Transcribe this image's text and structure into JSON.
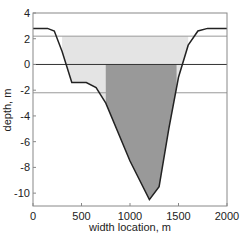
{
  "chart_data": {
    "type": "area",
    "title": "",
    "xlabel": "width location, m",
    "ylabel": "depth, m",
    "xlim": [
      0,
      2000
    ],
    "ylim": [
      -11,
      4
    ],
    "xticks": [
      0,
      500,
      1000,
      1500,
      2000
    ],
    "yticks": [
      4,
      2,
      0,
      -2,
      -4,
      -6,
      -8,
      -10
    ],
    "grid": false,
    "reference_lines": [
      {
        "y": 2.2,
        "color": "#999999"
      },
      {
        "y": 0,
        "color": "#333333"
      },
      {
        "y": -2.2,
        "color": "#999999"
      }
    ],
    "series": [
      {
        "name": "channel profile",
        "color": "#222222",
        "x": [
          0,
          150,
          220,
          300,
          400,
          550,
          650,
          750,
          1000,
          1200,
          1300,
          1400,
          1500,
          1600,
          1700,
          1800,
          2000
        ],
        "y": [
          2.8,
          2.8,
          2.6,
          1.0,
          -1.4,
          -1.4,
          -1.8,
          -3.0,
          -7.5,
          -10.5,
          -9.5,
          -5.0,
          -1.0,
          1.5,
          2.6,
          2.8,
          2.8
        ]
      }
    ],
    "fills": [
      {
        "name": "main channel",
        "x_range": [
          750,
          1480
        ],
        "top": 0,
        "color": "#999999"
      },
      {
        "name": "overbank",
        "x_range": [
          300,
          1600
        ],
        "top": 2.2,
        "color": "#e4e4e4"
      }
    ]
  }
}
